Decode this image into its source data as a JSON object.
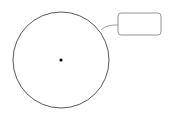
{
  "diagram": {
    "circle": {
      "cx": 61,
      "cy": 60,
      "r": 48,
      "stroke": "#444444",
      "fill": "#ffffff"
    },
    "center_point": {
      "cx": 61,
      "cy": 60,
      "r": 1.6,
      "color": "#000000"
    },
    "callout": {
      "x": 118,
      "y": 13,
      "width": 43,
      "height": 22,
      "rx": 3,
      "stroke": "#888888",
      "text": ""
    },
    "connector": {
      "stroke": "#888888"
    }
  }
}
